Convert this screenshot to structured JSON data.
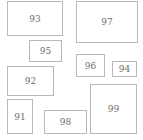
{
  "boxes": [
    {
      "label": "93",
      "x": 7,
      "y": 1,
      "w": 56,
      "h": 35
    },
    {
      "label": "97",
      "x": 76,
      "y": 1,
      "w": 62,
      "h": 42
    },
    {
      "label": "95",
      "x": 29,
      "y": 40,
      "w": 33,
      "h": 22
    },
    {
      "label": "96",
      "x": 76,
      "y": 54,
      "w": 29,
      "h": 23
    },
    {
      "label": "94",
      "x": 112,
      "y": 61,
      "w": 25,
      "h": 16
    },
    {
      "label": "92",
      "x": 7,
      "y": 66,
      "w": 47,
      "h": 30
    },
    {
      "label": "91",
      "x": 7,
      "y": 99,
      "w": 26,
      "h": 35
    },
    {
      "label": "98",
      "x": 44,
      "y": 110,
      "w": 43,
      "h": 24
    },
    {
      "label": "99",
      "x": 90,
      "y": 84,
      "w": 47,
      "h": 50
    }
  ]
}
